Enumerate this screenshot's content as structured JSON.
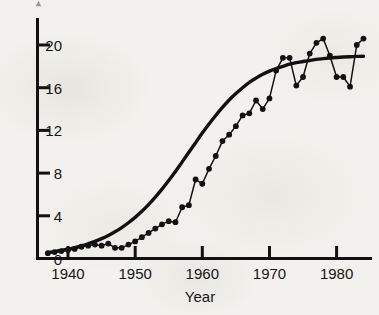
{
  "figure": {
    "background_color": "#f3f1ed",
    "ink_color": "#111111",
    "width": 379,
    "height": 315
  },
  "axes": {
    "x_title": "Year",
    "y_title": "",
    "x_tick_labels": [
      "1940",
      "1950",
      "1960",
      "1970",
      "1980"
    ],
    "y_tick_labels": [
      "0",
      "4",
      "8",
      "12",
      "16",
      "20"
    ]
  },
  "chart_data": {
    "type": "line",
    "title": "",
    "subtitle": "",
    "xlabel": "Year",
    "ylabel": "",
    "xlim": [
      1937,
      1984
    ],
    "ylim": [
      0,
      21.5
    ],
    "xticks": [
      1940,
      1950,
      1960,
      1970,
      1980
    ],
    "yticks": [
      0,
      4,
      8,
      12,
      16,
      20
    ],
    "grid": false,
    "legend": null,
    "legend_position": "none",
    "annotations": [],
    "x": [
      1937,
      1938,
      1939,
      1940,
      1941,
      1942,
      1943,
      1944,
      1945,
      1946,
      1947,
      1948,
      1949,
      1950,
      1951,
      1952,
      1953,
      1954,
      1955,
      1956,
      1957,
      1958,
      1959,
      1960,
      1961,
      1962,
      1963,
      1964,
      1965,
      1966,
      1967,
      1968,
      1969,
      1970,
      1971,
      1972,
      1973,
      1974,
      1975,
      1976,
      1977,
      1978,
      1979,
      1980,
      1981,
      1982,
      1983,
      1984
    ],
    "series": [
      {
        "name": "observed",
        "style": "markers-with-thin-line",
        "values": [
          0.5,
          0.6,
          0.7,
          0.8,
          0.9,
          1.1,
          1.2,
          1.3,
          1.2,
          1.4,
          1.0,
          1.0,
          1.3,
          1.6,
          2.0,
          2.4,
          2.8,
          3.2,
          3.5,
          3.4,
          4.8,
          5.0,
          7.4,
          7.0,
          8.4,
          9.6,
          11.0,
          11.6,
          12.4,
          13.4,
          13.6,
          14.8,
          14.0,
          15.0,
          17.6,
          18.8,
          18.8,
          16.2,
          17.0,
          19.2,
          20.2,
          20.6,
          19.0,
          17.0,
          17.0,
          16.1,
          20.0,
          20.6
        ]
      },
      {
        "name": "fitted-logistic-curve",
        "style": "thick-smooth-line",
        "values": [
          0.55,
          0.65,
          0.75,
          0.88,
          1.02,
          1.18,
          1.38,
          1.6,
          1.86,
          2.16,
          2.5,
          2.9,
          3.35,
          3.85,
          4.42,
          5.05,
          5.75,
          6.5,
          7.3,
          8.15,
          9.05,
          9.95,
          10.85,
          11.75,
          12.6,
          13.4,
          14.15,
          14.85,
          15.45,
          16.0,
          16.5,
          16.9,
          17.25,
          17.55,
          17.8,
          18.0,
          18.2,
          18.35,
          18.45,
          18.55,
          18.65,
          18.72,
          18.78,
          18.83,
          18.87,
          18.9,
          18.93,
          18.95
        ]
      }
    ]
  }
}
